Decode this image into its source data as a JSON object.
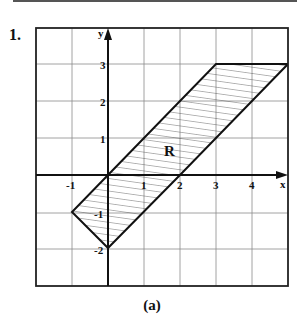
{
  "problem_number": "1.",
  "caption": "(a)",
  "region_label": "R",
  "axes": {
    "x_label": "x",
    "y_label": "y",
    "x_ticks": [
      "-1",
      "1",
      "2",
      "3",
      "4"
    ],
    "y_ticks": [
      "3",
      "2",
      "1",
      "-1",
      "-2"
    ],
    "x_range": [
      -2,
      5
    ],
    "y_range": [
      -3,
      4
    ]
  },
  "region": {
    "vertices": [
      [
        0,
        0
      ],
      [
        3,
        3
      ],
      [
        5,
        3
      ],
      [
        0,
        -2
      ],
      [
        -1,
        -1
      ]
    ],
    "fill": "hatched"
  },
  "colors": {
    "ink": "#111111",
    "grid": "#8a8a8a"
  }
}
